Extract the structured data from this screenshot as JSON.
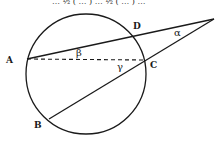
{
  "diagram": {
    "type": "circle-geometry",
    "top_caption_partial": "… ½ ( … ) … ½ ( … ) …",
    "points": [
      {
        "id": "A",
        "label": "A",
        "x": 27,
        "y": 59
      },
      {
        "id": "B",
        "label": "B",
        "x": 49,
        "y": 119
      },
      {
        "id": "C",
        "label": "C",
        "x": 145,
        "y": 60
      },
      {
        "id": "D",
        "label": "D",
        "x": 135,
        "y": 34
      },
      {
        "id": "P",
        "label": "",
        "x": 214,
        "y": 19
      }
    ],
    "circle": {
      "cx": 86,
      "cy": 74,
      "r": 60
    },
    "angles": [
      {
        "id": "alpha",
        "label": "α",
        "x": 190,
        "y": 33
      },
      {
        "id": "beta",
        "label": "β",
        "x": 78,
        "y": 58
      },
      {
        "id": "gamma",
        "label": "γ",
        "x": 118,
        "y": 69
      }
    ],
    "segments": [
      {
        "from": "A",
        "to": "P",
        "style": "solid"
      },
      {
        "from": "B",
        "to": "P",
        "style": "solid"
      },
      {
        "from": "A",
        "to": "C",
        "style": "dashed"
      }
    ],
    "colors": {
      "stroke": "#1a1a1a",
      "background": "#ffffff"
    }
  }
}
